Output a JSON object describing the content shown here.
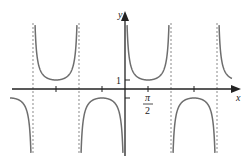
{
  "chart_data": {
    "type": "line",
    "title": "",
    "function": "y = csc(x)",
    "xlabel": "x",
    "ylabel": "y",
    "x_tick_label": "π/2",
    "x_tick_label_num": "π",
    "x_tick_label_den": "2",
    "y_tick_label": "1",
    "xlim_radians": [
      -5.3,
      4.9
    ],
    "ylim": [
      -7.4,
      7.6
    ],
    "asymptotes_radians": [
      -9.4248,
      -6.2832,
      -3.1416,
      3.1416,
      6.2832
    ],
    "asymptote_style": "dashed",
    "grid": false,
    "legend": null,
    "branches": [
      {
        "interval": "(-3π,-2π)",
        "sign": "negative",
        "extremum": {
          "x": "-5π/2",
          "y": -1
        }
      },
      {
        "interval": "(-2π,-π)",
        "sign": "positive",
        "extremum": {
          "x": "-3π/2",
          "y": 1
        }
      },
      {
        "interval": "(-π,0)",
        "sign": "negative",
        "extremum": {
          "x": "-π/2",
          "y": -1
        }
      },
      {
        "interval": "(0,π)",
        "sign": "positive",
        "extremum": {
          "x": "π/2",
          "y": 1
        }
      },
      {
        "interval": "(π,2π)",
        "sign": "negative",
        "extremum": {
          "x": "3π/2",
          "y": -1
        }
      },
      {
        "interval": "(2π,3π)",
        "sign": "positive",
        "extremum": {
          "x": "5π/2",
          "y": 1
        }
      }
    ]
  },
  "colors": {
    "curve": "#6e6e6e",
    "axis": "#222222",
    "asymptote": "#8a8a8a"
  }
}
